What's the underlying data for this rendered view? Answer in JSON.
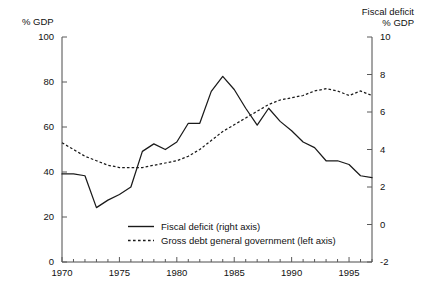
{
  "chart_data": {
    "type": "line",
    "title": "",
    "subtitle": "",
    "left_axis_label": "% GDP",
    "right_axis_label_line1": "Fiscal deficit",
    "right_axis_label_line2": "% GDP",
    "xlabel": "",
    "ylabel": "% GDP",
    "ylim": [
      0,
      100
    ],
    "y2lim": [
      -2,
      10
    ],
    "xlim": [
      1970,
      1997
    ],
    "grid": false,
    "legend_position": "inside-bottom-center",
    "left_ticks": [
      "0",
      "20",
      "40",
      "60",
      "80",
      "100"
    ],
    "left_tick_values": [
      0,
      20,
      40,
      60,
      80,
      100
    ],
    "right_ticks": [
      "-2",
      "0",
      "2",
      "4",
      "6",
      "8",
      "10"
    ],
    "right_tick_values": [
      -2,
      0,
      2,
      4,
      6,
      8,
      10
    ],
    "x_tick_labels": [
      "1970",
      "1975",
      "1980",
      "1985",
      "1990",
      "1995"
    ],
    "x_tick_label_values": [
      1970,
      1975,
      1980,
      1985,
      1990,
      1995
    ],
    "x_minor_ticks": [
      1970,
      1971,
      1972,
      1973,
      1974,
      1975,
      1976,
      1977,
      1978,
      1979,
      1980,
      1981,
      1982,
      1983,
      1984,
      1985,
      1986,
      1987,
      1988,
      1989,
      1990,
      1991,
      1992,
      1993,
      1994,
      1995,
      1996,
      1997
    ],
    "x": [
      1970,
      1971,
      1972,
      1973,
      1974,
      1975,
      1976,
      1977,
      1978,
      1979,
      1980,
      1981,
      1982,
      1983,
      1984,
      1985,
      1986,
      1987,
      1988,
      1989,
      1990,
      1991,
      1992,
      1993,
      1994,
      1995,
      1996,
      1997
    ],
    "series": [
      {
        "name": "Fiscal deficit (right axis)",
        "axis": "right",
        "style": "solid",
        "color": "#1a1a1a",
        "values": [
          2.7,
          2.7,
          2.6,
          0.9,
          1.3,
          1.6,
          2.0,
          3.9,
          4.3,
          4.0,
          4.4,
          5.4,
          5.4,
          7.1,
          7.9,
          7.2,
          6.2,
          5.3,
          6.2,
          5.5,
          5.0,
          4.4,
          4.1,
          3.4,
          3.4,
          3.2,
          2.6,
          2.5
        ]
      },
      {
        "name": "Gross debt general government (left axis)",
        "axis": "left",
        "style": "dotted",
        "color": "#1a1a1a",
        "values": [
          53,
          50,
          47,
          45,
          43,
          42,
          42,
          42,
          43,
          44,
          45,
          47,
          50,
          54,
          58,
          61,
          64,
          67,
          70,
          72,
          73,
          74,
          76,
          77,
          76,
          74,
          76,
          74
        ]
      }
    ]
  },
  "legend": {
    "items": [
      {
        "label": "Fiscal deficit (right axis)",
        "style": "solid"
      },
      {
        "label": "Gross debt general government (left axis)",
        "style": "dotted"
      }
    ]
  }
}
